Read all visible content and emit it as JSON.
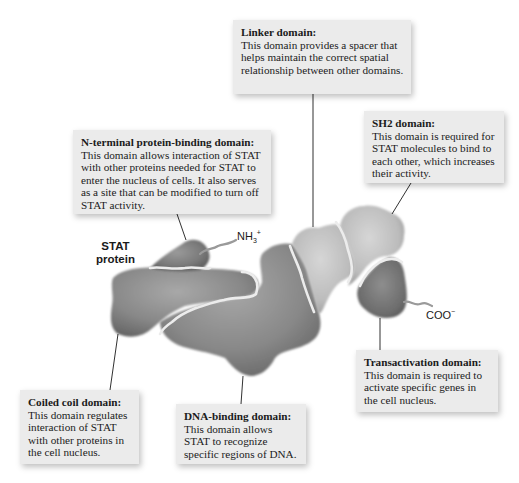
{
  "figure": {
    "protein_label_line1": "STAT",
    "protein_label_line2": "protein",
    "n_terminus": {
      "base": "NH",
      "sub": "3",
      "sup": "+"
    },
    "c_terminus": {
      "base": "COO",
      "sup": "−"
    },
    "colors": {
      "background": "#ffffff",
      "callout_fill": "#ebebeb",
      "protein_dark": "#6e6e6e",
      "protein_mid": "#8a8a8a",
      "protein_light": "#bdbdbd",
      "boundary_line": "#e8e8e8",
      "leader_line": "#1a1a1a"
    }
  },
  "callouts": {
    "linker": {
      "title": "Linker domain:",
      "body": "This domain provides a spacer that helps maintain the correct spatial relationship between other domains."
    },
    "sh2": {
      "title": "SH2 domain:",
      "body": "This domain is required for STAT molecules to bind to each other, which increases their activity."
    },
    "n_terminal": {
      "title": "N-terminal protein-binding domain:",
      "body": "This domain allows interaction of STAT with other proteins needed for STAT to enter the nucleus of cells. It also serves as a site that can be modified to turn off STAT activity."
    },
    "coiled_coil": {
      "title": "Coiled coil domain:",
      "body": "This domain regulates interaction of STAT with other proteins in the cell nucleus."
    },
    "dna_binding": {
      "title": "DNA-binding domain:",
      "body": "This domain allows STAT to recognize specific regions of DNA."
    },
    "transactivation": {
      "title": "Transactivation domain:",
      "body": "This domain is required to activate specific genes in the cell nucleus."
    }
  }
}
